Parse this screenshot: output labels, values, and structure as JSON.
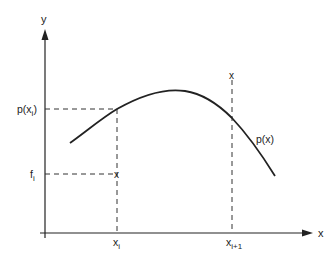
{
  "diagram": {
    "type": "interpolation-polynomial-sketch",
    "axes": {
      "x_label": "x",
      "y_label": "y"
    },
    "curve": {
      "label": "p(x)",
      "points": [
        [
          70,
          143
        ],
        [
          117,
          109
        ],
        [
          150,
          94
        ],
        [
          185,
          91
        ],
        [
          210,
          100
        ],
        [
          232,
          118
        ],
        [
          255,
          144
        ],
        [
          275,
          176
        ]
      ]
    },
    "y_markers": [
      {
        "id": "p_xi",
        "label_main": "p(x",
        "label_sub": "i",
        "label_close": ")",
        "y": 109
      },
      {
        "id": "f_i",
        "label_main": "f",
        "label_sub": "i",
        "y": 174
      }
    ],
    "x_markers": [
      {
        "id": "x_i",
        "label_main": "x",
        "label_sub": "i",
        "x": 117
      },
      {
        "id": "x_i_plus_1",
        "label_main": "x",
        "label_sub": "i+1",
        "x": 232
      }
    ],
    "data_points": [
      {
        "id": "point-xi-fi",
        "symbol": "x",
        "x": 117,
        "y": 174
      },
      {
        "id": "point-xi1-fi1",
        "symbol": "x",
        "x": 232,
        "y": 75
      }
    ],
    "colors": {
      "ink": "#222222",
      "background": "#ffffff"
    }
  }
}
